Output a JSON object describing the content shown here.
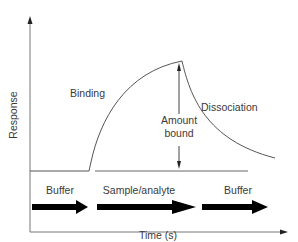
{
  "diagram": {
    "axes": {
      "y_label": "Response",
      "x_label": "Time (s)"
    },
    "phases": {
      "binding": "Binding",
      "dissociation": "Dissociation",
      "amount_bound_line1": "Amount",
      "amount_bound_line2": "bound"
    },
    "flow_steps": [
      {
        "label": "Buffer"
      },
      {
        "label": "Sample/analyte"
      },
      {
        "label": "Buffer"
      }
    ],
    "colors": {
      "line": "#555555",
      "arrow_fill": "#000000",
      "text": "#3a3a3a"
    }
  }
}
